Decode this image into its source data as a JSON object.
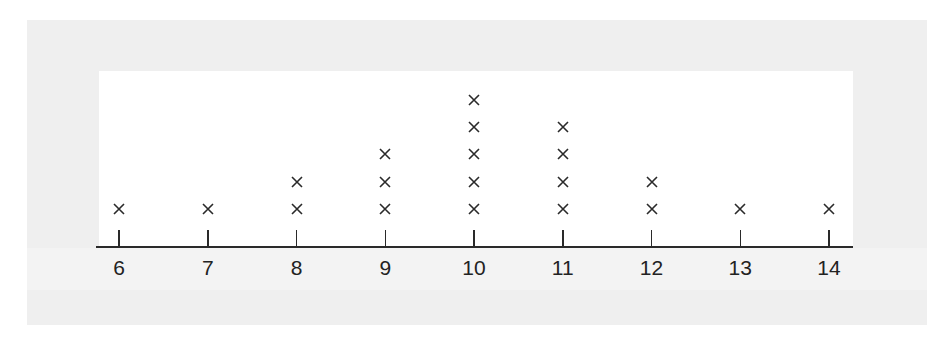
{
  "chart_data": {
    "type": "dot plot",
    "title": "",
    "xlabel": "",
    "ylabel": "",
    "categories": [
      "6",
      "7",
      "8",
      "9",
      "10",
      "11",
      "12",
      "13",
      "14"
    ],
    "values": [
      1,
      1,
      2,
      3,
      5,
      4,
      2,
      1,
      1
    ],
    "marker": "×",
    "xlim": [
      6,
      14
    ],
    "grid": false,
    "legend": null
  },
  "axis": {
    "ticks": [
      "6",
      "7",
      "8",
      "9",
      "10",
      "11",
      "12",
      "13",
      "14"
    ]
  },
  "colors": {
    "panel": "#efefef",
    "plot_bg": "#ffffff",
    "ink": "#2a2a2a"
  }
}
